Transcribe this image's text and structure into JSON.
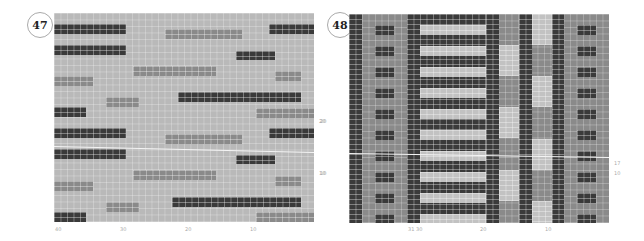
{
  "figures": [
    {
      "number": "47",
      "x_ticks": [
        "40",
        "30",
        "20",
        "10"
      ],
      "y_ticks": [
        "20",
        "10"
      ]
    },
    {
      "number": "48",
      "x_ticks": [
        "31 30",
        "20",
        "10"
      ],
      "y_ticks": [
        "20",
        "10",
        "17",
        "10"
      ]
    }
  ],
  "colors": {
    "background": "#b9b9b9",
    "dark": "#3a3a3a",
    "mid": "#8a8a8a",
    "light": "#c2c2c2"
  }
}
